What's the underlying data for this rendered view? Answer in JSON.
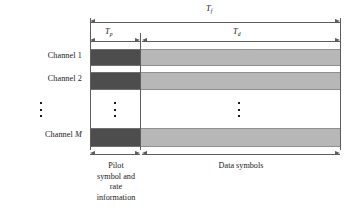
{
  "figure": {
    "type": "frame-structure-diagram"
  },
  "channels": {
    "labels": [
      {
        "prefix": "Channel ",
        "index": "1"
      },
      {
        "prefix": "Channel ",
        "index": "2"
      },
      {
        "prefix": "Channel ",
        "index": "M"
      }
    ],
    "ellipsis_dots": 3
  },
  "dimensions": {
    "frame": {
      "symbol": "T",
      "subscript": "f"
    },
    "pilot": {
      "symbol": "T",
      "subscript": "p"
    },
    "data": {
      "symbol": "T",
      "subscript": "d"
    }
  },
  "captions": {
    "pilot": [
      "Pilot",
      "symbol  and",
      "rate",
      "information"
    ],
    "data": [
      "Data symbols"
    ]
  },
  "colors": {
    "pilot_block": "#4d4d4d",
    "data_block": "#b7b7b7",
    "line": "#5d5d5d",
    "text": "#1b1b1b",
    "background": "#ffffff"
  }
}
